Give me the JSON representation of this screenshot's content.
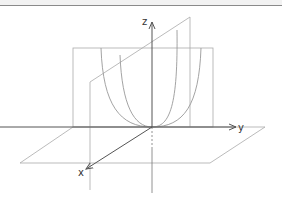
{
  "diagram": {
    "axes": {
      "x_label": "x",
      "y_label": "y",
      "z_label": "z"
    },
    "colors": {
      "axis": "#555555",
      "plane": "#aaaaaa",
      "curve": "#999999",
      "topbar_border": "#8a8a8a"
    }
  }
}
